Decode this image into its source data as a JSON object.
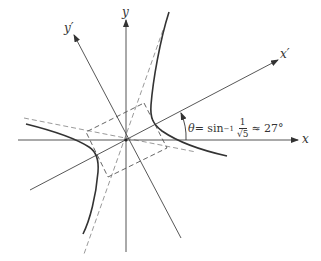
{
  "labels": {
    "x_axis": "x",
    "y_axis": "y",
    "x_prime_axis": "x′",
    "y_prime_axis": "y′"
  },
  "angle_annotation": {
    "theta": "θ",
    "equals": " = sin",
    "inverse_exp": "−1",
    "frac_num": "1",
    "frac_den": "√5",
    "approx": "≈ 27°"
  },
  "colors": {
    "axes": "#555555",
    "hyperbola": "#333333",
    "asymptotes": "#9a9a9a",
    "rectangle": "#555555"
  }
}
